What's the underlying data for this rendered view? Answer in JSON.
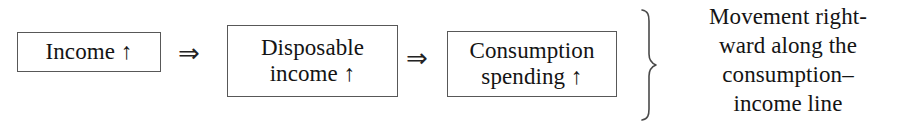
{
  "diagram": {
    "type": "flow-chain",
    "background_color": "#ffffff",
    "text_color": "#141414",
    "border_color": "#585858",
    "nodes": [
      {
        "id": "income",
        "label": "Income ↑"
      },
      {
        "id": "disposable",
        "label": "Disposable\nincome ↑"
      },
      {
        "id": "consumption",
        "label": "Consumption\nspending ↑"
      }
    ],
    "connectors": [
      {
        "id": "arrow-1",
        "glyph": "⇒",
        "from": "income",
        "to": "disposable"
      },
      {
        "id": "arrow-2",
        "glyph": "⇒",
        "from": "disposable",
        "to": "consumption"
      }
    ],
    "brace": {
      "glyph": "}",
      "groups": "all-nodes"
    },
    "caption": {
      "lines": [
        "Movement right-",
        "ward along the",
        "consumption–",
        "income line"
      ],
      "full_text": "Movement rightward along the consumption–income line"
    }
  }
}
